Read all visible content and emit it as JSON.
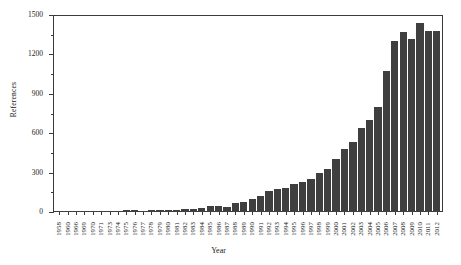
{
  "chart_data": {
    "type": "bar",
    "title": "",
    "xlabel": "Year",
    "ylabel": "References",
    "ylim": [
      0,
      1500
    ],
    "yticks": [
      0,
      300,
      600,
      900,
      1200,
      1500
    ],
    "ytick_labels": [
      "0",
      "300",
      "600",
      "900",
      "1200",
      "1500"
    ],
    "yminor_ticks": [
      150,
      450,
      750,
      1050,
      1350
    ],
    "grid": false,
    "legend": false,
    "bar_color": "#3f3f3f",
    "axis_color": "#3a3a3a",
    "background": "#ffffff",
    "categories": [
      "1958",
      "1960",
      "1966",
      "1969",
      "1970",
      "1971",
      "1973",
      "1974",
      "1975",
      "1976",
      "1977",
      "1978",
      "1979",
      "1980",
      "1981",
      "1982",
      "1983",
      "1984",
      "1985",
      "1986",
      "1987",
      "1988",
      "1989",
      "1990",
      "1991",
      "1992",
      "1993",
      "1994",
      "1995",
      "1996",
      "1997",
      "1998",
      "1999",
      "2000",
      "2001",
      "2002",
      "2003",
      "2004",
      "2005",
      "2006",
      "2007",
      "2008",
      "2009",
      "2010",
      "2011",
      "2012"
    ],
    "values": [
      2,
      2,
      2,
      3,
      3,
      4,
      8,
      9,
      12,
      18,
      10,
      14,
      14,
      15,
      18,
      24,
      25,
      30,
      45,
      48,
      40,
      72,
      78,
      100,
      125,
      160,
      175,
      185,
      210,
      230,
      255,
      300,
      330,
      400,
      480,
      530,
      640,
      700,
      800,
      1070,
      1300,
      1370,
      1320,
      1440,
      1375,
      1380
    ]
  }
}
